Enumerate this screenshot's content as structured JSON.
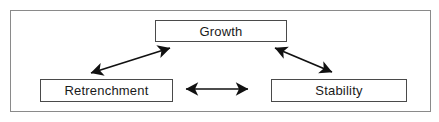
{
  "diagram": {
    "frame": {
      "name": "outer-frame",
      "border_color": "#8a8a8a",
      "background": "#ffffff"
    },
    "style": {
      "node_border_color": "#4a4a4a",
      "node_fill_color": "#ffffff",
      "text_color": "#1a1a1a",
      "arrow_color": "#111111"
    },
    "nodes": [
      {
        "id": "growth",
        "label": "Growth",
        "x": 155,
        "y": 20,
        "width": 132,
        "height": 22
      },
      {
        "id": "retrenchment",
        "label": "Retrenchment",
        "x": 40,
        "y": 79,
        "width": 133,
        "height": 23
      },
      {
        "id": "stability",
        "label": "Stability",
        "x": 271,
        "y": 79,
        "width": 136,
        "height": 23
      }
    ],
    "connectors": [
      {
        "id": "growth-retrenchment",
        "from": "growth",
        "to": "retrenchment",
        "direction": "bidirectional",
        "x1": 170,
        "y1": 48,
        "x2": 91,
        "y2": 73
      },
      {
        "id": "growth-stability",
        "from": "growth",
        "to": "stability",
        "direction": "bidirectional",
        "x1": 275,
        "y1": 48,
        "x2": 332,
        "y2": 72
      },
      {
        "id": "retrenchment-stability",
        "from": "retrenchment",
        "to": "stability",
        "direction": "bidirectional",
        "x1": 186,
        "y1": 89,
        "x2": 248,
        "y2": 89
      }
    ]
  }
}
